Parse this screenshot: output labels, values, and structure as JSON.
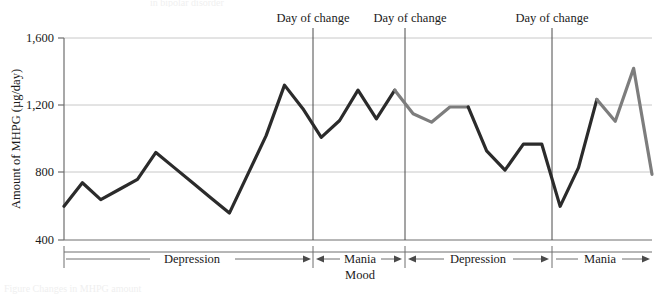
{
  "figure": {
    "top_cut_text": "in bipolar disorder",
    "bottom_cut_text": "Figure  Changes in MHPG amount"
  },
  "axes": {
    "y_label": "Amount of MHPG (µg/day)",
    "y_ticks": [
      "400",
      "800",
      "1,200",
      "1,600"
    ],
    "y_tick_values": [
      400,
      800,
      1200,
      1600
    ],
    "x_axis_title": "Mood"
  },
  "annotations": {
    "day_of_change_label": "Day of change",
    "day_of_change_count": 3
  },
  "mood_segments": [
    {
      "label": "Depression"
    },
    {
      "label": "Mania"
    },
    {
      "label": "Depression"
    },
    {
      "label": "Mania"
    }
  ],
  "colors": {
    "depression_line": "#2b2b2b",
    "mania_line": "#7d7d7d",
    "gridline": "#c8c8c8",
    "axis": "#6e6e6e",
    "text": "#1a1a1a"
  },
  "chart_data": {
    "type": "line",
    "title": "",
    "xlabel": "Mood",
    "ylabel": "Amount of MHPG (µg/day)",
    "ylim": [
      400,
      1600
    ],
    "yticks": [
      400,
      800,
      1200,
      1600
    ],
    "grid": true,
    "legend": "none",
    "x_unit": "day",
    "change_days": [
      19,
      23,
      30
    ],
    "series": [
      {
        "name": "Depression",
        "color": "#2b2b2b",
        "x": [
          1,
          2,
          3,
          4,
          5,
          6,
          7,
          8,
          9,
          10,
          11,
          12,
          13,
          14,
          15,
          16,
          17,
          18,
          19
        ],
        "values": [
          600,
          740,
          640,
          700,
          760,
          920,
          830,
          740,
          650,
          560,
          790,
          1020,
          1320,
          1180,
          1010,
          1110,
          1290,
          1120,
          1290
        ]
      },
      {
        "name": "Mania",
        "color": "#7d7d7d",
        "x": [
          19,
          20,
          21,
          22,
          23
        ],
        "values": [
          1290,
          1150,
          1100,
          1190,
          1190
        ]
      },
      {
        "name": "Depression",
        "color": "#2b2b2b",
        "x": [
          23,
          24,
          25,
          26,
          27,
          28,
          29,
          30
        ],
        "values": [
          1190,
          930,
          815,
          970,
          970,
          600,
          830,
          1235
        ]
      },
      {
        "name": "Mania",
        "color": "#7d7d7d",
        "x": [
          30,
          31,
          32,
          33
        ],
        "values": [
          1235,
          1105,
          1420,
          790
        ]
      }
    ]
  }
}
